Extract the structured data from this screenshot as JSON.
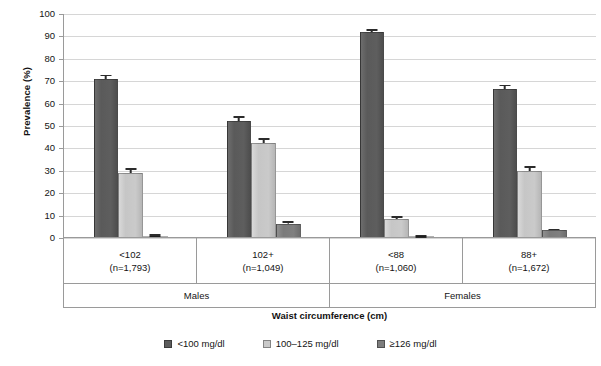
{
  "chart_data": {
    "type": "bar",
    "title": "",
    "xlabel": "Waist circumference (cm)",
    "ylabel": "Prevalence (%)",
    "ylim": [
      0,
      100
    ],
    "ytick_step": 10,
    "yticks": [
      100,
      90,
      80,
      70,
      60,
      50,
      40,
      30,
      20,
      10,
      0
    ],
    "grid": true,
    "legend_position": "bottom",
    "categories": [
      "<102",
      "102+",
      "<88",
      "88+"
    ],
    "category_counts": [
      "(n=1,793)",
      "(n=1,049)",
      "(n=1,060)",
      "(n=1,672)"
    ],
    "supergroups": [
      {
        "label": "Males",
        "span": 2
      },
      {
        "label": "Females",
        "span": 2
      }
    ],
    "series": [
      {
        "name": "<100 mg/dl",
        "color": "#5c5c5c",
        "values": [
          70.5,
          52.0,
          91.5,
          66.0
        ],
        "errors": [
          2.0,
          2.0,
          1.2,
          2.0
        ]
      },
      {
        "name": "100–125 mg/dl",
        "color": "#c9c9c9",
        "values": [
          28.8,
          42.0,
          8.0,
          29.5
        ],
        "errors": [
          2.0,
          2.2,
          1.2,
          2.2
        ]
      },
      {
        "name": "≥126 mg/dl",
        "color": "#7d7d7d",
        "values": [
          0.6,
          6.0,
          0.3,
          3.0
        ],
        "errors": [
          0.3,
          1.0,
          0.2,
          0.8
        ]
      }
    ]
  },
  "legend": {
    "items": [
      {
        "label": "<100 mg/dl"
      },
      {
        "label": "100–125 mg/dl"
      },
      {
        "label": "≥126 mg/dl"
      }
    ]
  }
}
